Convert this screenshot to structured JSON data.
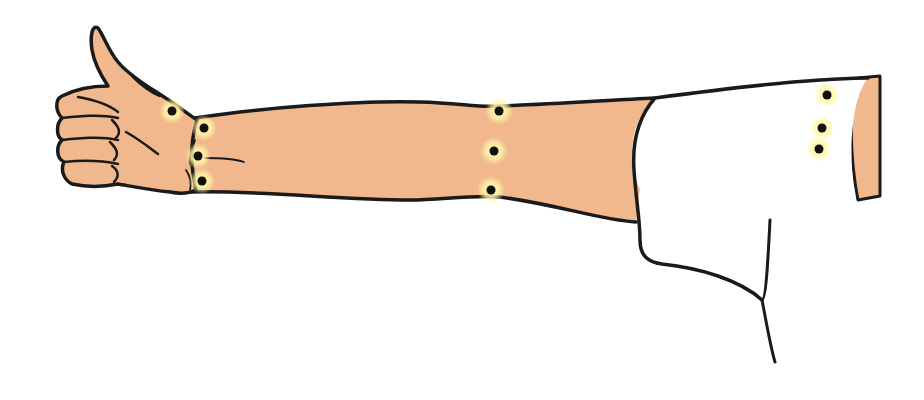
{
  "figure": {
    "title": "Arm with thumbs-up hand showing marked points",
    "colors": {
      "skin": "#F0B88C",
      "outline": "#1a1a1a",
      "sleeve": "#ffffff",
      "point": "#111111",
      "point_glow": "#FFF7A8",
      "background": "#ffffff"
    },
    "points": [
      {
        "id": "hand-dorsum",
        "x": 172,
        "y": 111
      },
      {
        "id": "wrist-top",
        "x": 204,
        "y": 128
      },
      {
        "id": "wrist-middle",
        "x": 198,
        "y": 156
      },
      {
        "id": "wrist-bottom",
        "x": 202,
        "y": 181
      },
      {
        "id": "forearm-top",
        "x": 499,
        "y": 111
      },
      {
        "id": "forearm-middle",
        "x": 494,
        "y": 151
      },
      {
        "id": "forearm-bottom",
        "x": 491,
        "y": 190
      },
      {
        "id": "upper-arm-top",
        "x": 827,
        "y": 95
      },
      {
        "id": "upper-arm-middle",
        "x": 822,
        "y": 128
      },
      {
        "id": "upper-arm-bottom",
        "x": 819,
        "y": 149
      }
    ]
  }
}
